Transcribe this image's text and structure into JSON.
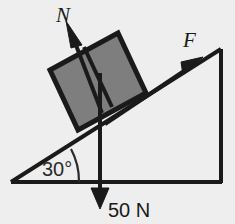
{
  "figure": {
    "background_color": "#eeeeee",
    "line_color": "#1a1a1a",
    "block_fill_color": "#7e7e7e",
    "incline_angle_degrees": 30
  },
  "labels": {
    "normal_force": "N",
    "applied_force": "F",
    "weight": "50 N",
    "angle": "30°"
  },
  "geometry": {
    "baseline_y": 182,
    "apex_x": 221,
    "apex_y": 50,
    "origin_x": 11,
    "origin_y": 182,
    "block_corners": "50,70 118,33 146,93 78,130",
    "divider": "84,47 112,107",
    "normal_shaft": "101,111 72,36",
    "normal_tip": "66,22",
    "force_shaft": "108,121 189,67",
    "force_tip": "202,58",
    "weight_shaft": "100,74 100,192",
    "weight_tip": "100,208",
    "angle_arc": "r=60"
  }
}
